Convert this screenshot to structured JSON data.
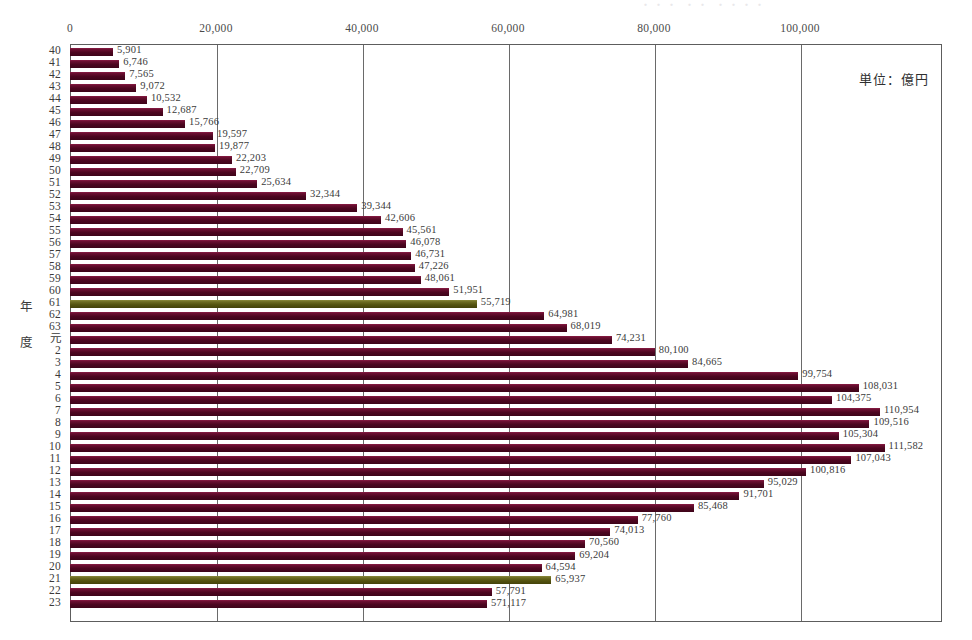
{
  "meta": {
    "top_ghost_text": "・・・  ・・  ・・・・",
    "unit_caption": "単位：億円",
    "y_axis_title_chars": [
      "年",
      "度"
    ],
    "bar_color": "#5c0b29",
    "bar_highlight_color": "#6e6d23",
    "frame_color": "#5d5d5d",
    "grid_color": "#6a6a6a"
  },
  "chart_data": {
    "type": "bar",
    "orientation": "horizontal",
    "title": "",
    "subtitle": "",
    "xlabel": "",
    "ylabel": "年度",
    "unit": "億円",
    "xlim": [
      0,
      120000
    ],
    "xticks": [
      0,
      20000,
      40000,
      60000,
      80000,
      100000
    ],
    "xtick_labels": [
      "0",
      "20,000",
      "40,000",
      "60,000",
      "80,000",
      "100,000"
    ],
    "grid": true,
    "legend": null,
    "legend_position": "none",
    "categories": [
      "40",
      "41",
      "42",
      "43",
      "44",
      "45",
      "46",
      "47",
      "48",
      "49",
      "50",
      "51",
      "52",
      "53",
      "54",
      "55",
      "56",
      "57",
      "58",
      "59",
      "60",
      "61",
      "62",
      "63",
      "元",
      "2",
      "3",
      "4",
      "5",
      "6",
      "7",
      "8",
      "9",
      "10",
      "11",
      "12",
      "13",
      "14",
      "15",
      "16",
      "17",
      "18",
      "19",
      "20",
      "21",
      "22",
      "23"
    ],
    "values": [
      5901,
      6746,
      7565,
      9072,
      10532,
      12687,
      15766,
      19597,
      19877,
      22203,
      22709,
      25634,
      32344,
      39344,
      42606,
      45561,
      46078,
      46731,
      47226,
      48061,
      51951,
      55719,
      64981,
      68019,
      74231,
      80100,
      84665,
      99754,
      108031,
      104375,
      110954,
      109516,
      105304,
      111582,
      107043,
      100816,
      95029,
      91701,
      85468,
      77760,
      74013,
      70560,
      69204,
      64594,
      65937,
      57791,
      57117
    ],
    "value_labels": [
      "5,901",
      "6,746",
      "7,565",
      "9,072",
      "10,532",
      "12,687",
      "15,766",
      "19,597",
      "19,877",
      "22,203",
      "22,709",
      "25,634",
      "32,344",
      "39,344",
      "42,606",
      "45,561",
      "46,078",
      "46,731",
      "47,226",
      "48,061",
      "51,951",
      "55,719",
      "64,981",
      "68,019",
      "74,231",
      "80,100",
      "84,665",
      "99,754",
      "108,031",
      "104,375",
      "110,954",
      "109,516",
      "105,304",
      "111,582",
      "107,043",
      "100,816",
      "95,029",
      "91,701",
      "85,468",
      "77,760",
      "74,013",
      "70,560",
      "69,204",
      "64,594",
      "65,937",
      "57,791",
      "571,117"
    ],
    "highlighted_categories": [
      "61",
      "21"
    ]
  }
}
